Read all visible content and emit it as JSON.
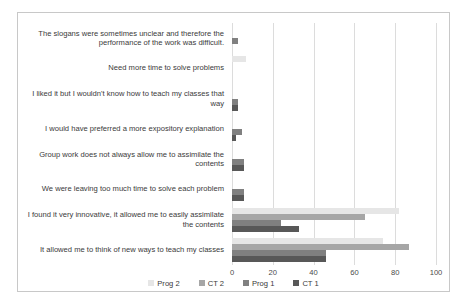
{
  "chart_data": {
    "type": "bar",
    "orientation": "horizontal",
    "title": "",
    "xlabel": "",
    "ylabel": "",
    "xlim": [
      0,
      100
    ],
    "xticks": [
      0,
      20,
      40,
      60,
      80,
      100
    ],
    "grid": true,
    "legend_position": "bottom",
    "categories": [
      "The slogans were sometimes unclear and therefore the performance of the work was difficult.",
      "Need more time to solve problems",
      "I liked it but I wouldn't know how to teach my classes that way",
      "I would have preferred a more expository explanation",
      "Group work does not always allow me to assimilate the contents",
      "We were leaving too much time to solve each problem",
      "I found it very innovative, it allowed me to easily assimilate the contents",
      "It allowed me to think of new ways to teach my classes"
    ],
    "series": [
      {
        "name": "Prog 2",
        "color": "#e6e6e6",
        "values": [
          0,
          7,
          0,
          0,
          0,
          0,
          82,
          74
        ]
      },
      {
        "name": "CT 2",
        "color": "#a6a6a6",
        "values": [
          0,
          0,
          0,
          0,
          0,
          0,
          65,
          87
        ]
      },
      {
        "name": "Prog 1",
        "color": "#808080",
        "values": [
          3,
          0,
          3,
          5,
          6,
          6,
          24,
          46
        ]
      },
      {
        "name": "CT 1",
        "color": "#585858",
        "values": [
          0,
          0,
          3,
          2,
          6,
          6,
          33,
          46
        ]
      }
    ]
  },
  "legend": {
    "items": [
      {
        "label": "Prog 2"
      },
      {
        "label": "CT 2"
      },
      {
        "label": "Prog 1"
      },
      {
        "label": "CT 1"
      }
    ]
  },
  "axis": {
    "tick_labels": [
      "0",
      "20",
      "40",
      "60",
      "80",
      "100"
    ]
  },
  "colors": {
    "frame_border": "#c8c8c8",
    "gridline": "#dcdcdc",
    "axis": "#b4b4b4",
    "text": "#3a3a3a",
    "background": "#ffffff"
  }
}
